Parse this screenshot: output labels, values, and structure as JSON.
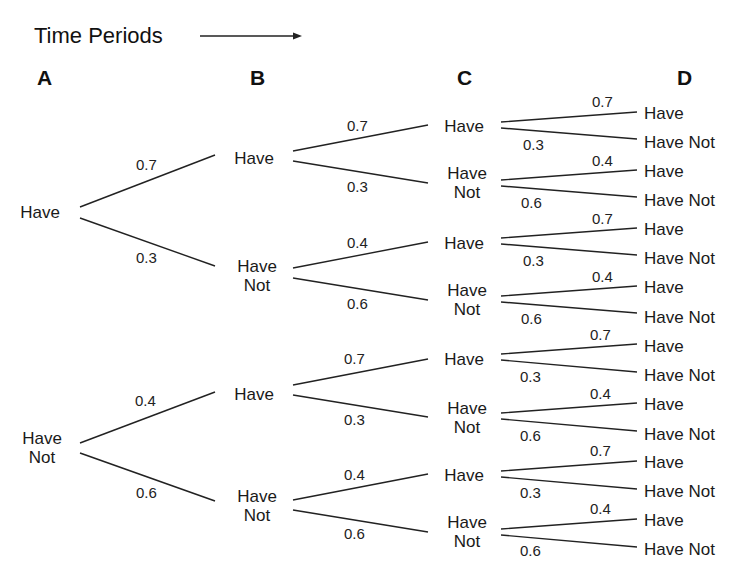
{
  "title": "Time Periods",
  "arrow": {
    "x1": 200,
    "y1": 36,
    "x2": 302,
    "y2": 36
  },
  "columns": [
    {
      "label": "A",
      "x": 45
    },
    {
      "label": "B",
      "x": 258
    },
    {
      "label": "C",
      "x": 465
    },
    {
      "label": "D",
      "x": 685
    }
  ],
  "column_y": 80,
  "line_color": "#222222",
  "nodes": [
    {
      "id": "A1",
      "lines": [
        "Have"
      ],
      "x": 40,
      "y": 212
    },
    {
      "id": "A2",
      "lines": [
        "Have",
        "Not"
      ],
      "x": 42,
      "y": 448
    },
    {
      "id": "B1",
      "lines": [
        "Have"
      ],
      "x": 254,
      "y": 158
    },
    {
      "id": "B2",
      "lines": [
        "Have",
        "Not"
      ],
      "x": 257,
      "y": 276
    },
    {
      "id": "B3",
      "lines": [
        "Have"
      ],
      "x": 254,
      "y": 394
    },
    {
      "id": "B4",
      "lines": [
        "Have",
        "Not"
      ],
      "x": 257,
      "y": 506
    },
    {
      "id": "C1",
      "lines": [
        "Have"
      ],
      "x": 464,
      "y": 126
    },
    {
      "id": "C2",
      "lines": [
        "Have",
        "Not"
      ],
      "x": 467,
      "y": 183
    },
    {
      "id": "C3",
      "lines": [
        "Have"
      ],
      "x": 464,
      "y": 243
    },
    {
      "id": "C4",
      "lines": [
        "Have",
        "Not"
      ],
      "x": 467,
      "y": 300
    },
    {
      "id": "C5",
      "lines": [
        "Have"
      ],
      "x": 464,
      "y": 359
    },
    {
      "id": "C6",
      "lines": [
        "Have",
        "Not"
      ],
      "x": 467,
      "y": 418
    },
    {
      "id": "C7",
      "lines": [
        "Have"
      ],
      "x": 464,
      "y": 475
    },
    {
      "id": "C8",
      "lines": [
        "Have",
        "Not"
      ],
      "x": 467,
      "y": 532
    }
  ],
  "leaves": [
    {
      "label": "Have",
      "y": 113
    },
    {
      "label": "Have Not",
      "y": 142
    },
    {
      "label": "Have",
      "y": 171
    },
    {
      "label": "Have Not",
      "y": 200
    },
    {
      "label": "Have",
      "y": 229
    },
    {
      "label": "Have Not",
      "y": 258
    },
    {
      "label": "Have",
      "y": 287
    },
    {
      "label": "Have Not",
      "y": 317
    },
    {
      "label": "Have",
      "y": 346
    },
    {
      "label": "Have Not",
      "y": 375
    },
    {
      "label": "Have",
      "y": 404
    },
    {
      "label": "Have Not",
      "y": 434
    },
    {
      "label": "Have",
      "y": 462
    },
    {
      "label": "Have Not",
      "y": 491
    },
    {
      "label": "Have",
      "y": 520
    },
    {
      "label": "Have Not",
      "y": 549
    }
  ],
  "leaf_x": 644,
  "edges": [
    {
      "x1": 80,
      "y1": 207,
      "x2": 215,
      "y2": 155,
      "p": "0.7",
      "px": 136,
      "py": 157
    },
    {
      "x1": 80,
      "y1": 218,
      "x2": 215,
      "y2": 266,
      "p": "0.3",
      "px": 136,
      "py": 250
    },
    {
      "x1": 80,
      "y1": 443,
      "x2": 215,
      "y2": 392,
      "p": "0.4",
      "px": 135,
      "py": 393
    },
    {
      "x1": 80,
      "y1": 453,
      "x2": 215,
      "y2": 501,
      "p": "0.6",
      "px": 136,
      "py": 485
    },
    {
      "x1": 293,
      "y1": 151,
      "x2": 428,
      "y2": 125,
      "p": "0.7",
      "px": 347,
      "py": 118
    },
    {
      "x1": 293,
      "y1": 161,
      "x2": 428,
      "y2": 183,
      "p": "0.3",
      "px": 347,
      "py": 179
    },
    {
      "x1": 293,
      "y1": 268,
      "x2": 428,
      "y2": 242,
      "p": "0.4",
      "px": 347,
      "py": 235
    },
    {
      "x1": 293,
      "y1": 278,
      "x2": 428,
      "y2": 300,
      "p": "0.6",
      "px": 347,
      "py": 296
    },
    {
      "x1": 293,
      "y1": 385,
      "x2": 428,
      "y2": 359,
      "p": "0.7",
      "px": 344,
      "py": 351
    },
    {
      "x1": 293,
      "y1": 395,
      "x2": 428,
      "y2": 417,
      "p": "0.3",
      "px": 344,
      "py": 412
    },
    {
      "x1": 293,
      "y1": 500,
      "x2": 428,
      "y2": 474,
      "p": "0.4",
      "px": 344,
      "py": 467
    },
    {
      "x1": 293,
      "y1": 510,
      "x2": 428,
      "y2": 532,
      "p": "0.6",
      "px": 344,
      "py": 526
    },
    {
      "x1": 501,
      "y1": 122,
      "x2": 637,
      "y2": 112,
      "p": "0.7",
      "px": 592,
      "py": 94
    },
    {
      "x1": 501,
      "y1": 128,
      "x2": 637,
      "y2": 139,
      "p": "0.3",
      "px": 523,
      "py": 137
    },
    {
      "x1": 501,
      "y1": 180,
      "x2": 637,
      "y2": 170,
      "p": "0.4",
      "px": 592,
      "py": 153
    },
    {
      "x1": 501,
      "y1": 186,
      "x2": 637,
      "y2": 197,
      "p": "0.6",
      "px": 521,
      "py": 195
    },
    {
      "x1": 501,
      "y1": 238,
      "x2": 637,
      "y2": 228,
      "p": "0.7",
      "px": 592,
      "py": 211
    },
    {
      "x1": 501,
      "y1": 244,
      "x2": 637,
      "y2": 255,
      "p": "0.3",
      "px": 523,
      "py": 253
    },
    {
      "x1": 501,
      "y1": 296,
      "x2": 637,
      "y2": 286,
      "p": "0.4",
      "px": 592,
      "py": 269
    },
    {
      "x1": 501,
      "y1": 302,
      "x2": 637,
      "y2": 313,
      "p": "0.6",
      "px": 521,
      "py": 311
    },
    {
      "x1": 501,
      "y1": 354,
      "x2": 637,
      "y2": 344,
      "p": "0.7",
      "px": 590,
      "py": 327
    },
    {
      "x1": 501,
      "y1": 360,
      "x2": 637,
      "y2": 372,
      "p": "0.3",
      "px": 520,
      "py": 369
    },
    {
      "x1": 501,
      "y1": 413,
      "x2": 637,
      "y2": 403,
      "p": "0.4",
      "px": 590,
      "py": 386
    },
    {
      "x1": 501,
      "y1": 419,
      "x2": 637,
      "y2": 431,
      "p": "0.6",
      "px": 520,
      "py": 428
    },
    {
      "x1": 501,
      "y1": 471,
      "x2": 637,
      "y2": 461,
      "p": "0.7",
      "px": 590,
      "py": 443
    },
    {
      "x1": 501,
      "y1": 477,
      "x2": 637,
      "y2": 489,
      "p": "0.3",
      "px": 520,
      "py": 485
    },
    {
      "x1": 501,
      "y1": 529,
      "x2": 637,
      "y2": 519,
      "p": "0.4",
      "px": 590,
      "py": 501
    },
    {
      "x1": 501,
      "y1": 535,
      "x2": 637,
      "y2": 547,
      "p": "0.6",
      "px": 520,
      "py": 543
    }
  ]
}
